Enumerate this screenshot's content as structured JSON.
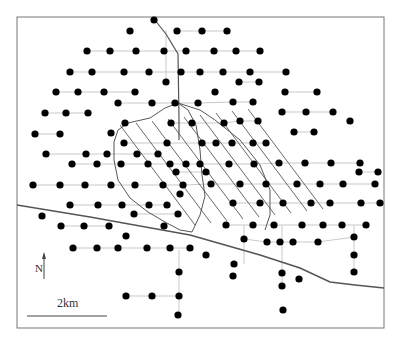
{
  "map": {
    "frame": {
      "x": 17,
      "y": 17,
      "w": 367,
      "h": 311,
      "color": "#777777"
    },
    "colors": {
      "dot": "#000000",
      "thin_line": "#bbbbbb",
      "road": "#555555",
      "hatch": "#444444"
    },
    "north_label": "N",
    "scale_label": "2km",
    "scale_bar": {
      "x1": 27,
      "x2": 107,
      "y": 316
    },
    "north_arrow": {
      "x": 44,
      "y1": 254,
      "y2": 279
    },
    "main_road": [
      [
        17,
        205
      ],
      [
        90,
        217
      ],
      [
        190,
        235
      ],
      [
        260,
        255
      ],
      [
        300,
        268
      ],
      [
        330,
        282
      ],
      [
        355,
        285
      ],
      [
        384,
        288
      ]
    ],
    "north_road": [
      [
        154,
        19
      ],
      [
        166,
        34
      ],
      [
        178,
        54
      ],
      [
        179,
        120
      ],
      [
        179,
        140
      ]
    ],
    "dot_rows": [
      [
        [
          154,
          20
        ]
      ],
      [
        [
          130,
          31
        ],
        [
          177,
          31
        ],
        [
          202,
          31
        ],
        [
          227,
          31
        ]
      ],
      [
        [
          87,
          51
        ],
        [
          110,
          51
        ],
        [
          136,
          51
        ],
        [
          164,
          51
        ],
        [
          186,
          51
        ],
        [
          214,
          51
        ],
        [
          236,
          51
        ],
        [
          260,
          51
        ]
      ],
      [
        [
          70,
          72
        ],
        [
          92,
          72
        ],
        [
          124,
          72
        ],
        [
          149,
          72
        ],
        [
          181,
          72
        ],
        [
          200,
          72
        ],
        [
          223,
          72
        ],
        [
          250,
          72
        ],
        [
          286,
          72
        ]
      ],
      [
        [
          166,
          82
        ],
        [
          239,
          82
        ],
        [
          259,
          82
        ]
      ],
      [
        [
          56,
          92
        ],
        [
          78,
          92
        ],
        [
          104,
          92
        ],
        [
          135,
          92
        ],
        [
          215,
          92
        ],
        [
          285,
          92
        ],
        [
          317,
          92
        ]
      ],
      [
        [
          118,
          103
        ],
        [
          152,
          103
        ],
        [
          175,
          103
        ],
        [
          198,
          103
        ],
        [
          233,
          102
        ],
        [
          253,
          102
        ]
      ],
      [
        [
          45,
          113
        ],
        [
          66,
          113
        ],
        [
          88,
          113
        ],
        [
          282,
          112
        ],
        [
          306,
          112
        ],
        [
          333,
          112
        ]
      ],
      [
        [
          125,
          123
        ],
        [
          171,
          123
        ],
        [
          192,
          123
        ],
        [
          224,
          123
        ],
        [
          240,
          121
        ],
        [
          258,
          121
        ],
        [
          350,
          121
        ]
      ],
      [
        [
          111,
          133
        ],
        [
          294,
          132
        ],
        [
          314,
          132
        ]
      ],
      [
        [
          35,
          134
        ],
        [
          60,
          134
        ],
        [
          124,
          143
        ],
        [
          167,
          143
        ],
        [
          216,
          143
        ],
        [
          232,
          143
        ],
        [
          253,
          143
        ],
        [
          202,
          143
        ],
        [
          266,
          143
        ]
      ],
      [
        [
          46,
          154
        ],
        [
          86,
          154
        ],
        [
          107,
          154
        ],
        [
          137,
          154
        ],
        [
          158,
          154
        ]
      ],
      [
        [
          72,
          164
        ],
        [
          97,
          164
        ],
        [
          121,
          164
        ],
        [
          148,
          164
        ],
        [
          170,
          164
        ],
        [
          186,
          164
        ],
        [
          200,
          164
        ],
        [
          229,
          164
        ],
        [
          254,
          164
        ],
        [
          279,
          163
        ],
        [
          305,
          163
        ],
        [
          331,
          163
        ],
        [
          360,
          163
        ]
      ],
      [
        [
          206,
          172
        ],
        [
          176,
          172
        ],
        [
          359,
          172
        ],
        [
          378,
          172
        ]
      ],
      [
        [
          33,
          185
        ],
        [
          60,
          185
        ],
        [
          85,
          185
        ],
        [
          111,
          185
        ],
        [
          135,
          185
        ],
        [
          163,
          185
        ],
        [
          183,
          185
        ],
        [
          211,
          184
        ],
        [
          240,
          184
        ],
        [
          266,
          184
        ],
        [
          297,
          184
        ],
        [
          320,
          184
        ],
        [
          343,
          184
        ],
        [
          375,
          184
        ]
      ],
      [
        [
          180,
          194
        ]
      ],
      [
        [
          70,
          205
        ],
        [
          98,
          205
        ],
        [
          122,
          205
        ],
        [
          149,
          205
        ],
        [
          167,
          205
        ],
        [
          233,
          203
        ],
        [
          260,
          203
        ],
        [
          283,
          203
        ],
        [
          311,
          203
        ],
        [
          330,
          203
        ],
        [
          361,
          203
        ],
        [
          380,
          203
        ]
      ],
      [
        [
          134,
          214
        ],
        [
          178,
          214
        ],
        [
          42,
          216
        ]
      ],
      [
        [
          61,
          226
        ],
        [
          84,
          226
        ],
        [
          109,
          226
        ],
        [
          164,
          226
        ],
        [
          226,
          225
        ],
        [
          253,
          225
        ],
        [
          274,
          225
        ],
        [
          302,
          225
        ],
        [
          323,
          225
        ],
        [
          342,
          225
        ],
        [
          366,
          225
        ]
      ],
      [
        [
          126,
          236
        ],
        [
          244,
          239
        ],
        [
          267,
          242
        ],
        [
          280,
          242
        ],
        [
          293,
          242
        ],
        [
          318,
          242
        ],
        [
          354,
          237
        ]
      ],
      [
        [
          73,
          248
        ],
        [
          97,
          248
        ],
        [
          118,
          248
        ],
        [
          147,
          248
        ],
        [
          170,
          248
        ],
        [
          190,
          248
        ]
      ],
      [
        [
          206,
          255
        ],
        [
          354,
          255
        ],
        [
          234,
          264
        ]
      ],
      [
        [
          179,
          272
        ],
        [
          354,
          272
        ],
        [
          233,
          276
        ],
        [
          282,
          273
        ],
        [
          282,
          286
        ],
        [
          299,
          279
        ]
      ],
      [
        [
          126,
          296
        ],
        [
          152,
          296
        ],
        [
          179,
          296
        ],
        [
          283,
          310
        ]
      ],
      [
        [
          178,
          315
        ]
      ]
    ],
    "hatch": {
      "outline": [
        [
          118,
          130
        ],
        [
          128,
          123
        ],
        [
          150,
          118
        ],
        [
          165,
          108
        ],
        [
          178,
          103
        ],
        [
          188,
          110
        ],
        [
          196,
          125
        ],
        [
          200,
          150
        ],
        [
          202,
          175
        ],
        [
          205,
          196
        ],
        [
          200,
          215
        ],
        [
          192,
          232
        ],
        [
          180,
          230
        ],
        [
          165,
          222
        ],
        [
          148,
          212
        ],
        [
          130,
          198
        ],
        [
          118,
          180
        ],
        [
          114,
          160
        ],
        [
          114,
          142
        ]
      ],
      "outer": [
        [
          178,
          103
        ],
        [
          200,
          110
        ],
        [
          215,
          120
        ],
        [
          240,
          140
        ],
        [
          260,
          165
        ],
        [
          270,
          190
        ],
        [
          270,
          215
        ],
        [
          265,
          230
        ]
      ],
      "lines": 9
    }
  }
}
